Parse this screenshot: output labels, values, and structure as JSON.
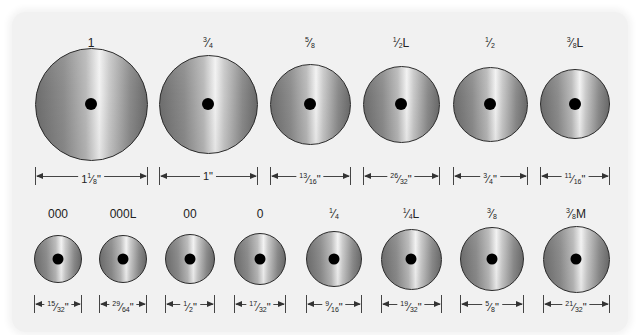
{
  "diagram": {
    "rows": [
      {
        "items": [
          {
            "size": "1",
            "measure": "1 1/8\"",
            "cx": 91,
            "diameter": 113,
            "hole": 12
          },
          {
            "size": "3/4",
            "measure": "1\"",
            "cx": 208,
            "diameter": 99,
            "hole": 12
          },
          {
            "size": "5/8",
            "measure": "13/16\"",
            "cx": 310,
            "diameter": 81,
            "hole": 12
          },
          {
            "size": "1/2L",
            "measure": "26/32\"",
            "cx": 401,
            "diameter": 77,
            "hole": 12
          },
          {
            "size": "1/2",
            "measure": "3/4\"",
            "cx": 490,
            "diameter": 75,
            "hole": 12
          },
          {
            "size": "3/8L",
            "measure": "11/16\"",
            "cx": 575,
            "diameter": 70,
            "hole": 12
          }
        ]
      },
      {
        "items": [
          {
            "size": "000",
            "measure": "15/32\"",
            "cx": 58,
            "diameter": 48,
            "hole": 11
          },
          {
            "size": "000L",
            "measure": "29/64\"",
            "cx": 123,
            "diameter": 48,
            "hole": 11
          },
          {
            "size": "00",
            "measure": "1/2\"",
            "cx": 190,
            "diameter": 50,
            "hole": 11
          },
          {
            "size": "0",
            "measure": "17/32\"",
            "cx": 260,
            "diameter": 52,
            "hole": 11
          },
          {
            "size": "1/4",
            "measure": "9/16\"",
            "cx": 334,
            "diameter": 56,
            "hole": 11
          },
          {
            "size": "1/4L",
            "measure": "19/32\"",
            "cx": 411,
            "diameter": 61,
            "hole": 11
          },
          {
            "size": "3/8",
            "measure": "5/8\"",
            "cx": 492,
            "diameter": 64,
            "hole": 11
          },
          {
            "size": "3/8M",
            "measure": "21/32\"",
            "cx": 576,
            "diameter": 67,
            "hole": 11
          }
        ]
      }
    ],
    "layout": {
      "row0": {
        "label_y": 36,
        "center_y": 104,
        "dim_y": 167
      },
      "row1": {
        "label_y": 207,
        "center_y": 259,
        "dim_y": 295
      }
    },
    "colors": {
      "panel": "#f1f1f1",
      "wheel_outline": "#2a2a2a",
      "hole": "#000000",
      "text": "#222222"
    }
  }
}
